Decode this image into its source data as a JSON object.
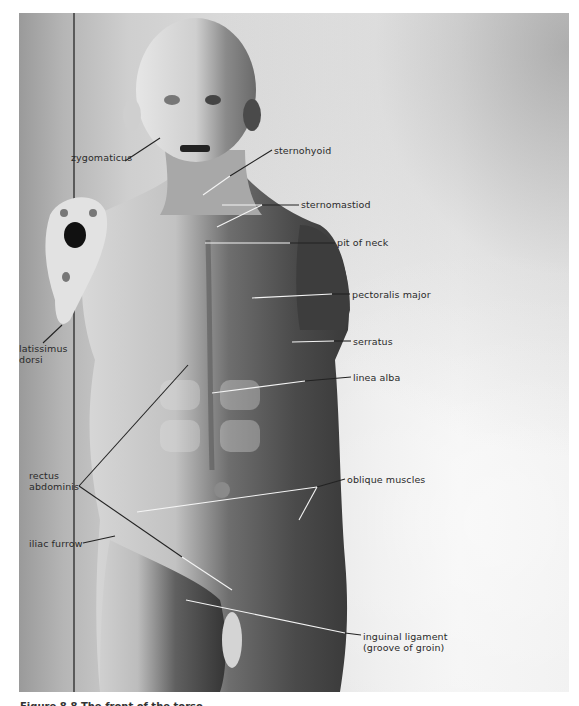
{
  "figure": {
    "type": "anatomical photograph, écorché torso with labeled muscles",
    "labels": [
      {
        "id": "zygomaticus",
        "text": "zygomaticus",
        "x": 71,
        "y": 152,
        "line": [
          [
            125,
            161
          ],
          [
            160,
            138
          ]
        ]
      },
      {
        "id": "sternohyoid",
        "text": "sternohyoid",
        "x": 274,
        "y": 145,
        "line": [
          [
            272,
            150
          ],
          [
            203,
            195
          ]
        ]
      },
      {
        "id": "sternomastiod",
        "text": "sternomastiod",
        "x": 301,
        "y": 199,
        "line": [
          [
            299,
            205
          ],
          [
            222,
            205
          ]
        ],
        "line2": [
          [
            262,
            205
          ],
          [
            217,
            227
          ]
        ]
      },
      {
        "id": "pit-of-neck",
        "text": "pit of neck",
        "x": 337,
        "y": 237,
        "line": [
          [
            335,
            243
          ],
          [
            205,
            243
          ]
        ]
      },
      {
        "id": "pectoralis-major",
        "text": "pectoralis major",
        "x": 352,
        "y": 289,
        "line": [
          [
            350,
            294
          ],
          [
            252,
            298
          ]
        ]
      },
      {
        "id": "serratus",
        "text": "serratus",
        "x": 353,
        "y": 336,
        "line": [
          [
            351,
            341
          ],
          [
            292,
            342
          ]
        ]
      },
      {
        "id": "linea-alba",
        "text": "linea alba",
        "x": 353,
        "y": 372,
        "line": [
          [
            351,
            377
          ],
          [
            212,
            393
          ]
        ]
      },
      {
        "id": "latissimus-dorsi",
        "text": "latissimus\ndorsi",
        "x": 19,
        "y": 343,
        "line": [
          [
            43,
            343
          ],
          [
            62,
            325
          ]
        ]
      },
      {
        "id": "rectus-abdominis",
        "text": "rectus\nabdominis",
        "x": 29,
        "y": 470,
        "line": [
          [
            79,
            486
          ],
          [
            188,
            365
          ]
        ],
        "line2": [
          [
            79,
            486
          ],
          [
            182,
            557
          ]
        ]
      },
      {
        "id": "oblique-muscles",
        "text": "oblique muscles",
        "x": 347,
        "y": 474,
        "line": [
          [
            345,
            479
          ],
          [
            317,
            487
          ]
        ],
        "line2": [
          [
            317,
            487
          ],
          [
            137,
            512
          ]
        ],
        "line3": [
          [
            317,
            487
          ],
          [
            299,
            520
          ]
        ]
      },
      {
        "id": "iliac-furrow",
        "text": "iliac furrow",
        "x": 29,
        "y": 538,
        "line": [
          [
            83,
            543
          ],
          [
            115,
            536
          ]
        ]
      },
      {
        "id": "inguinal-ligament",
        "text": "inguinal ligament",
        "x": 363,
        "y": 631,
        "line": [
          [
            361,
            635
          ],
          [
            186,
            600
          ]
        ],
        "line2": [
          [
            186,
            600
          ],
          [
            232,
            567
          ]
        ]
      },
      {
        "id": "inguinal-ligament-sub",
        "text": "(groove of groin)",
        "x": 363,
        "y": 642
      }
    ]
  },
  "caption": {
    "text": "Figure 8.8  The front of the torso"
  },
  "colors": {
    "label_text": "#2a2a2a",
    "leader_dark": "#222222",
    "leader_light": "#f4f4f4",
    "page_bg": "#ffffff"
  }
}
